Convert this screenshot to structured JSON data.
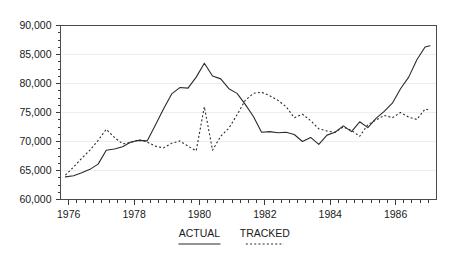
{
  "chart_data": {
    "type": "line",
    "title": "",
    "xlabel": "",
    "ylabel": "",
    "xlim": [
      1975.75,
      1987.25
    ],
    "ylim": [
      60000,
      90000
    ],
    "grid": true,
    "legend_position": "below-axis",
    "y_ticks": [
      60000,
      65000,
      70000,
      75000,
      80000,
      85000,
      90000
    ],
    "y_tick_labels": [
      "60,000",
      "65,000",
      "70,000",
      "75,000",
      "80,000",
      "85,000",
      "90,000"
    ],
    "y_minor_tick_step": 1250,
    "x_ticks": [
      1976,
      1978,
      1980,
      1982,
      1984,
      1986
    ],
    "x_tick_labels": [
      "1976",
      "1978",
      "1980",
      "1982",
      "1984",
      "1986"
    ],
    "x_minor_tick_step": 0.25,
    "series": [
      {
        "name": "ACTUAL",
        "style": "solid",
        "color": "#2b2b2b",
        "x": [
          1975.9,
          1976.15,
          1976.4,
          1976.65,
          1976.9,
          1977.15,
          1977.4,
          1977.65,
          1977.9,
          1978.15,
          1978.4,
          1978.65,
          1978.9,
          1979.15,
          1979.4,
          1979.65,
          1979.9,
          1980.15,
          1980.4,
          1980.65,
          1980.9,
          1981.15,
          1981.4,
          1981.65,
          1981.9,
          1982.15,
          1982.4,
          1982.65,
          1982.9,
          1983.15,
          1983.4,
          1983.65,
          1983.9,
          1984.15,
          1984.4,
          1984.65,
          1984.9,
          1985.15,
          1985.4,
          1985.65,
          1985.9,
          1986.15,
          1986.4,
          1986.65,
          1986.9,
          1987.05
        ],
        "y": [
          63900,
          64100,
          64600,
          65200,
          66100,
          68500,
          68700,
          69100,
          69900,
          70200,
          70100,
          72800,
          75600,
          78200,
          79300,
          79200,
          81100,
          83500,
          81300,
          80800,
          79100,
          78300,
          76400,
          74300,
          71600,
          71700,
          71500,
          71600,
          71200,
          70000,
          70700,
          69500,
          71100,
          71600,
          72700,
          71700,
          73400,
          72400,
          74000,
          75200,
          76600,
          79100,
          81100,
          84100,
          86300,
          86500
        ],
        "series_note": "Actual values, solid line"
      },
      {
        "name": "TRACKED",
        "style": "dotted",
        "color": "#2b2b2b",
        "x": [
          1975.9,
          1976.15,
          1976.4,
          1976.65,
          1976.9,
          1977.15,
          1977.4,
          1977.65,
          1977.9,
          1978.15,
          1978.4,
          1978.65,
          1978.9,
          1979.15,
          1979.4,
          1979.65,
          1979.9,
          1980.15,
          1980.4,
          1980.65,
          1980.9,
          1981.15,
          1981.4,
          1981.65,
          1981.9,
          1982.15,
          1982.4,
          1982.65,
          1982.9,
          1983.15,
          1983.4,
          1983.65,
          1983.9,
          1984.15,
          1984.4,
          1984.65,
          1984.9,
          1985.15,
          1985.4,
          1985.65,
          1985.9,
          1986.15,
          1986.4,
          1986.65,
          1986.9,
          1987.05
        ],
        "y": [
          64200,
          65600,
          67100,
          68500,
          70200,
          72100,
          70700,
          69600,
          69800,
          70300,
          69900,
          69200,
          68900,
          69700,
          70100,
          69200,
          68400,
          76000,
          68500,
          70900,
          72300,
          74600,
          77100,
          78300,
          78500,
          77900,
          77100,
          76000,
          74100,
          74700,
          73600,
          72200,
          71800,
          71600,
          72500,
          71900,
          70900,
          72900,
          73700,
          74500,
          74100,
          75000,
          74200,
          73800,
          75600,
          75400
        ],
        "series_note": "Tracked values, dotted line"
      }
    ]
  },
  "legend": {
    "entries": [
      {
        "label": "ACTUAL",
        "style": "solid"
      },
      {
        "label": "TRACKED",
        "style": "dotted"
      }
    ]
  }
}
